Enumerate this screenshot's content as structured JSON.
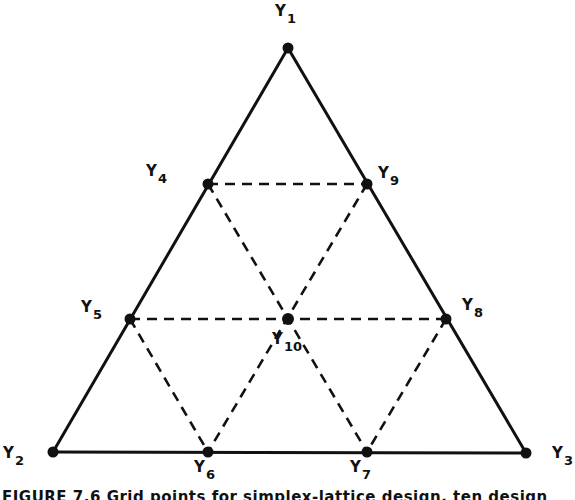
{
  "figure": {
    "caption": "FIGURE 7.6  Grid points for simplex-lattice design, ten design points",
    "caption_clipped": true
  },
  "nodes": [
    {
      "id": "Y1",
      "letter": "Y",
      "sub": "1",
      "x": 288,
      "y": 48,
      "label_x": 275,
      "label_y": 4
    },
    {
      "id": "Y2",
      "letter": "Y",
      "sub": "2",
      "x": 53,
      "y": 452,
      "label_x": 3,
      "label_y": 446
    },
    {
      "id": "Y3",
      "letter": "Y",
      "sub": "3",
      "x": 526,
      "y": 453,
      "label_x": 552,
      "label_y": 446
    },
    {
      "id": "Y4",
      "letter": "Y",
      "sub": "4",
      "x": 208,
      "y": 184,
      "label_x": 146,
      "label_y": 164
    },
    {
      "id": "Y5",
      "letter": "Y",
      "sub": "5",
      "x": 130,
      "y": 319,
      "label_x": 81,
      "label_y": 300
    },
    {
      "id": "Y6",
      "letter": "Y",
      "sub": "6",
      "x": 208,
      "y": 452,
      "label_x": 194,
      "label_y": 460
    },
    {
      "id": "Y7",
      "letter": "Y",
      "sub": "7",
      "x": 367,
      "y": 452,
      "label_x": 350,
      "label_y": 460
    },
    {
      "id": "Y8",
      "letter": "Y",
      "sub": "8",
      "x": 446,
      "y": 319,
      "label_x": 462,
      "label_y": 298
    },
    {
      "id": "Y9",
      "letter": "Y",
      "sub": "9",
      "x": 367,
      "y": 184,
      "label_x": 378,
      "label_y": 166
    },
    {
      "id": "Y10",
      "letter": "Y",
      "sub": "10",
      "x": 288,
      "y": 319,
      "label_x": 272,
      "label_y": 332
    }
  ],
  "solid_edges": [
    [
      "Y1",
      "Y2"
    ],
    [
      "Y1",
      "Y3"
    ],
    [
      "Y2",
      "Y3"
    ]
  ],
  "dashed_edges": [
    [
      "Y4",
      "Y9"
    ],
    [
      "Y5",
      "Y8"
    ],
    [
      "Y4",
      "Y7"
    ],
    [
      "Y9",
      "Y6"
    ],
    [
      "Y5",
      "Y6"
    ],
    [
      "Y8",
      "Y7"
    ]
  ],
  "style": {
    "stroke": "#111111",
    "background": "#ffffff"
  }
}
